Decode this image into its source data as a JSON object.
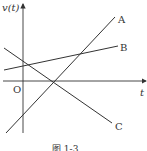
{
  "figure": {
    "y_axis_label": "v(t)",
    "x_axis_label": "t",
    "origin_label": "O",
    "caption": "图 1-3",
    "lines": [
      {
        "name": "A",
        "x1": 6,
        "y1": 133,
        "x2": 115,
        "y2": 17
      },
      {
        "name": "B",
        "x1": 4,
        "y1": 70,
        "x2": 118,
        "y2": 46
      },
      {
        "name": "C",
        "x1": 4,
        "y1": 48,
        "x2": 112,
        "y2": 123
      }
    ],
    "color": "#333333"
  }
}
